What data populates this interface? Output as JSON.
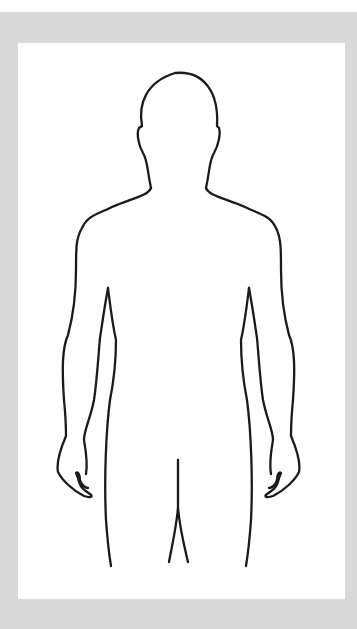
{
  "figure": {
    "colors": {
      "border": "#d9d9d9",
      "panel": "#ffffff",
      "outline": "#1a1a1a"
    }
  }
}
